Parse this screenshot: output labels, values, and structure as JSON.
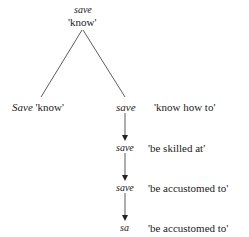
{
  "diagram": {
    "root": {
      "form": "save",
      "gloss": "'know'"
    },
    "left_branch": {
      "form": "Save",
      "gloss": "'know'"
    },
    "chain": [
      {
        "form": "save",
        "gloss": "'know how to'"
      },
      {
        "form": "save",
        "gloss": "'be skilled at'"
      },
      {
        "form": "save",
        "gloss": "'be accustomed to'"
      },
      {
        "form": "sa",
        "gloss": "'be accustomed to'"
      }
    ],
    "colors": {
      "ink": "#222222",
      "background": "#ffffff"
    }
  }
}
